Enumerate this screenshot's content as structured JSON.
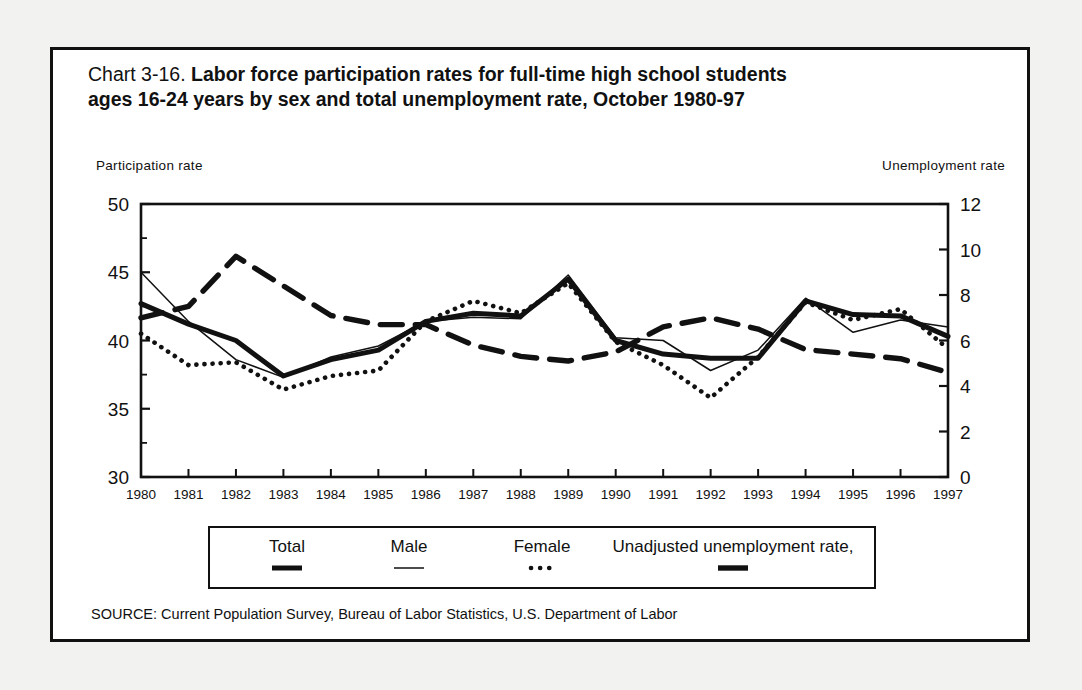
{
  "figure": {
    "title_prefix": "Chart 3-16.",
    "title_bold": "Labor force participation rates for full-time high school students ages 16-24 years by sex and total unemployment rate, October 1980-97",
    "source": "SOURCE: Current Population Survey, Bureau of Labor Statistics, U.S. Department of Labor",
    "ink_color": "#111111",
    "paper_color": "#ffffff",
    "page_color": "#f2f2f0"
  },
  "chart_data": {
    "type": "line",
    "title": "Chart 3-16. Labor force participation rates for full-time high school students ages 16-24 years by sex and total unemployment rate, October 1980-97",
    "xlabel": "",
    "ylabel": "Participation rate",
    "y2label": "Unemployment rate",
    "grid": false,
    "legend_position": "bottom",
    "x": [
      1980,
      1981,
      1982,
      1983,
      1984,
      1985,
      1986,
      1987,
      1988,
      1989,
      1990,
      1991,
      1992,
      1993,
      1994,
      1995,
      1996,
      1997
    ],
    "categories": [
      "1980",
      "1981",
      "1982",
      "1983",
      "1984",
      "1985",
      "1986",
      "1987",
      "1988",
      "1989",
      "1990",
      "1991",
      "1992",
      "1993",
      "1994",
      "1995",
      "1996",
      "1997"
    ],
    "ylim": [
      30,
      50
    ],
    "yticks": [
      30,
      35,
      40,
      45,
      50
    ],
    "ytick_labels": [
      "30",
      "35",
      "40",
      "45",
      "50"
    ],
    "y2lim": [
      0,
      12
    ],
    "y2ticks": [
      0,
      2,
      4,
      6,
      8,
      10,
      12
    ],
    "y2tick_labels": [
      "0",
      "2",
      "4",
      "6",
      "8",
      "10",
      "12"
    ],
    "series": [
      {
        "name": "Total",
        "axis": "left",
        "style": "thick-solid",
        "values": [
          42.7,
          41.2,
          40.0,
          37.4,
          38.6,
          39.3,
          41.4,
          42.0,
          41.8,
          44.5,
          40.0,
          39.0,
          38.7,
          38.7,
          42.9,
          41.9,
          41.8,
          40.3
        ]
      },
      {
        "name": "Male",
        "axis": "left",
        "style": "thin-solid",
        "values": [
          45.0,
          41.4,
          38.6,
          37.3,
          38.8,
          39.6,
          41.4,
          41.7,
          41.6,
          44.8,
          40.2,
          40.0,
          37.8,
          39.3,
          43.1,
          40.6,
          41.5,
          41.0
        ]
      },
      {
        "name": "Female",
        "axis": "left",
        "style": "dotted",
        "values": [
          40.5,
          38.2,
          38.4,
          36.4,
          37.4,
          37.8,
          41.4,
          42.9,
          42.0,
          44.2,
          39.9,
          38.2,
          35.8,
          38.8,
          42.8,
          41.5,
          42.3,
          39.4
        ]
      },
      {
        "name": "Unadjusted unemployment rate,",
        "axis": "right",
        "style": "thick-dashed",
        "values": [
          7.0,
          7.5,
          9.7,
          8.4,
          7.1,
          6.7,
          6.7,
          5.8,
          5.3,
          5.1,
          5.5,
          6.6,
          7.0,
          6.5,
          5.6,
          5.4,
          5.2,
          4.6
        ]
      }
    ]
  },
  "legend": {
    "items": [
      {
        "label": "Total",
        "style": "thick-solid"
      },
      {
        "label": "Male",
        "style": "thin-solid"
      },
      {
        "label": "Female",
        "style": "dotted"
      },
      {
        "label": "Unadjusted unemployment rate,",
        "style": "thick-dashed"
      }
    ]
  }
}
